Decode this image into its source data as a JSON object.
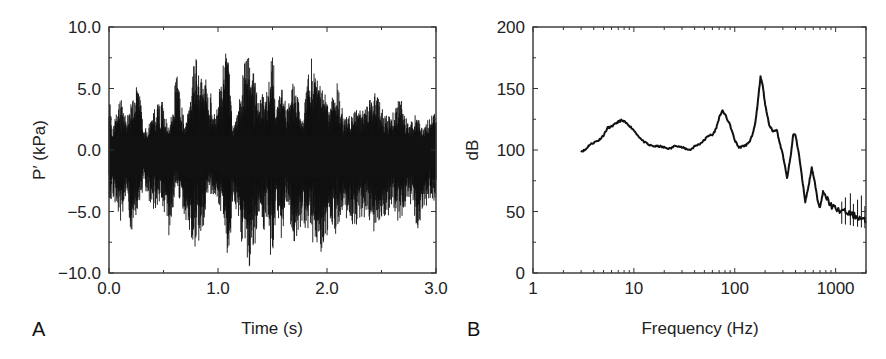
{
  "figure": {
    "panels": [
      "A",
      "B"
    ]
  },
  "chart_data": [
    {
      "id": "A",
      "type": "line",
      "title": "",
      "panel_label": "A",
      "xlabel": "Time (s)",
      "ylabel": "P′ (kPa)",
      "xlim": [
        0.0,
        3.0
      ],
      "ylim": [
        -10.0,
        10.0
      ],
      "xticks": [
        0.0,
        1.0,
        2.0,
        3.0
      ],
      "xtick_labels": [
        "0.0",
        "1.0",
        "2.0",
        "3.0"
      ],
      "yticks": [
        -10.0,
        -5.0,
        0.0,
        5.0,
        10.0
      ],
      "ytick_labels": [
        "−10.0",
        "−5.0",
        "0.0",
        "5.0",
        "10.0"
      ],
      "grid": false,
      "legend": null,
      "description": "Dense oscillating pressure fluctuation signal; envelope (approx. positive/negative peak per burst) listed below",
      "envelope": {
        "t": [
          0.0,
          0.03,
          0.1,
          0.16,
          0.21,
          0.27,
          0.32,
          0.4,
          0.48,
          0.55,
          0.62,
          0.7,
          0.79,
          0.85,
          0.91,
          0.98,
          1.05,
          1.1,
          1.13,
          1.2,
          1.27,
          1.32,
          1.37,
          1.45,
          1.5,
          1.53,
          1.58,
          1.63,
          1.7,
          1.77,
          1.85,
          1.9,
          1.96,
          2.02,
          2.08,
          2.15,
          2.22,
          2.28,
          2.35,
          2.45,
          2.52,
          2.6,
          2.67,
          2.75,
          2.82,
          2.88,
          2.95,
          3.0
        ],
        "max": [
          5.0,
          1.5,
          4.5,
          2.5,
          4.0,
          5.6,
          1.5,
          3.0,
          4.5,
          1.5,
          6.3,
          2.0,
          7.7,
          7.0,
          5.8,
          2.5,
          8.2,
          8.0,
          2.0,
          4.5,
          8.6,
          6.5,
          4.5,
          5.0,
          9.5,
          3.0,
          5.8,
          3.8,
          5.8,
          2.5,
          7.9,
          6.2,
          5.8,
          4.0,
          6.0,
          3.0,
          2.8,
          3.6,
          3.5,
          5.0,
          3.0,
          3.0,
          4.5,
          2.0,
          3.0,
          2.0,
          3.0,
          3.5
        ],
        "min": [
          -5.5,
          -3.5,
          -6.0,
          -4.0,
          -7.5,
          -5.0,
          -3.0,
          -5.0,
          -4.5,
          -7.0,
          -3.0,
          -6.0,
          -8.3,
          -7.5,
          -3.5,
          -4.0,
          -6.0,
          -10.0,
          -5.0,
          -7.0,
          -10.0,
          -8.5,
          -7.0,
          -6.5,
          -10.0,
          -5.0,
          -7.5,
          -4.5,
          -8.0,
          -6.0,
          -7.0,
          -9.5,
          -9.0,
          -6.0,
          -7.0,
          -5.0,
          -6.5,
          -6.0,
          -5.5,
          -7.0,
          -6.0,
          -5.0,
          -6.5,
          -4.0,
          -6.8,
          -5.0,
          -4.0,
          -4.5
        ]
      }
    },
    {
      "id": "B",
      "type": "line",
      "title": "",
      "panel_label": "B",
      "xlabel": "Frequency (Hz)",
      "ylabel": "dB",
      "xscale": "log",
      "xlim": [
        1,
        2000
      ],
      "ylim": [
        0,
        200
      ],
      "xticks": [
        1,
        10,
        100,
        1000
      ],
      "xtick_labels": [
        "1",
        "10",
        "100",
        "1000"
      ],
      "yticks": [
        0,
        50,
        100,
        150,
        200
      ],
      "ytick_labels": [
        "0",
        "50",
        "100",
        "150",
        "200"
      ],
      "grid": false,
      "legend": null,
      "series": [
        {
          "name": "spectrum",
          "x": [
            3.0,
            3.3,
            3.6,
            4.0,
            4.5,
            5.0,
            5.5,
            6.0,
            6.5,
            7.0,
            7.5,
            8.0,
            9.0,
            10,
            12,
            14,
            16,
            18,
            20,
            23,
            26,
            30,
            33,
            36,
            40,
            45,
            50,
            55,
            60,
            65,
            70,
            75,
            80,
            90,
            100,
            110,
            120,
            130,
            140,
            150,
            160,
            170,
            180,
            190,
            200,
            220,
            240,
            260,
            280,
            300,
            330,
            360,
            380,
            400,
            430,
            460,
            500,
            540,
            580,
            620,
            660,
            700,
            750,
            800,
            900,
            1000,
            1200,
            1400,
            1600,
            1800,
            2000
          ],
          "y": [
            99,
            100,
            104,
            106,
            108,
            112,
            118,
            119,
            121,
            123,
            124,
            123,
            120,
            116,
            108,
            104,
            103,
            103,
            102,
            101,
            104,
            102,
            101,
            100,
            103,
            105,
            108,
            112,
            112,
            117,
            126,
            132,
            129,
            120,
            108,
            102,
            103,
            104,
            107,
            112,
            122,
            140,
            160,
            152,
            137,
            120,
            115,
            117,
            105,
            96,
            77,
            96,
            113,
            112,
            98,
            80,
            58,
            71,
            86,
            74,
            60,
            53,
            66,
            62,
            55,
            52,
            50,
            48,
            46,
            44,
            42
          ]
        }
      ]
    }
  ]
}
